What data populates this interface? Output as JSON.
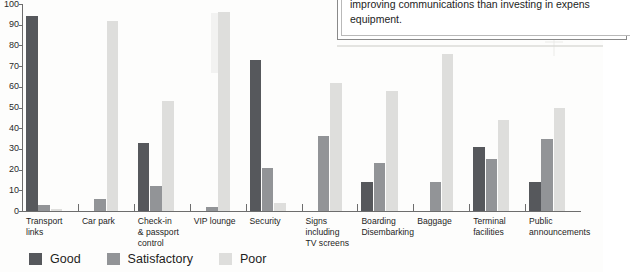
{
  "callout": {
    "text": "improving communications than investing in expens\nequipment."
  },
  "legend": {
    "position": "bottom-left",
    "items": [
      {
        "label": "Good",
        "color": "#56585c"
      },
      {
        "label": "Satisfactory",
        "color": "#929497"
      },
      {
        "label": "Poor",
        "color": "#dededc"
      }
    ]
  },
  "axis": {
    "y_ticks": [
      "100",
      "90",
      "80",
      "70",
      "60",
      "50",
      "40",
      "30",
      "20",
      "10",
      "0"
    ]
  },
  "chart_data": {
    "type": "bar",
    "title": "",
    "subtitle": "",
    "xlabel": "",
    "ylabel": "",
    "ylim": [
      0,
      100
    ],
    "ytick_step": 10,
    "grid": false,
    "legend_position": "bottom-left",
    "categories": [
      "Transport\nlinks",
      "Car park",
      "Check-in\n& passport\ncontrol",
      "VIP lounge",
      "Security",
      "Signs\nincluding\nTV screens",
      "Boarding\nDisembarking",
      "Baggage",
      "Terminal\nfacilities",
      "Public\nannouncements"
    ],
    "series": [
      {
        "name": "Good",
        "color": "#56585c",
        "values": [
          94,
          0,
          33,
          0,
          73,
          0,
          14,
          0,
          31,
          14
        ]
      },
      {
        "name": "Satisfactory",
        "color": "#929497",
        "values": [
          3,
          6,
          12,
          2,
          21,
          36,
          23,
          14,
          25,
          35
        ]
      },
      {
        "name": "Poor",
        "color": "#dededc",
        "values": [
          1,
          92,
          53,
          96,
          4,
          62,
          58,
          76,
          44,
          50
        ]
      }
    ]
  }
}
